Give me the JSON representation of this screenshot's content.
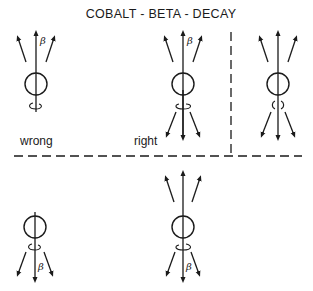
{
  "title": "COBALT - BETA - DECAY",
  "colors": {
    "ink": "#1a1a1a",
    "background": "#ffffff"
  },
  "beta_symbol": "β",
  "panels": [
    {
      "id": "top-left",
      "label": "wrong",
      "emission": "upward",
      "beta_side": "up",
      "spin": "counterclockwise-below"
    },
    {
      "id": "top-middle",
      "label": "right",
      "emission": "downward",
      "beta_side": "up",
      "spin": "clockwise-below"
    },
    {
      "id": "top-right",
      "label": "",
      "emission": "both",
      "beta_side": "",
      "spin": "split-curl-below"
    },
    {
      "id": "bottom-left",
      "label": "",
      "emission": "downward",
      "beta_side": "down",
      "spin": "counterclockwise-below"
    },
    {
      "id": "bottom-middle",
      "label": "",
      "emission": "both",
      "beta_side": "down",
      "spin": "clockwise-below"
    }
  ],
  "labels": {
    "wrong": "wrong",
    "right": "right"
  },
  "dividers": {
    "horizontal": "dashed",
    "vertical": "dashed"
  }
}
